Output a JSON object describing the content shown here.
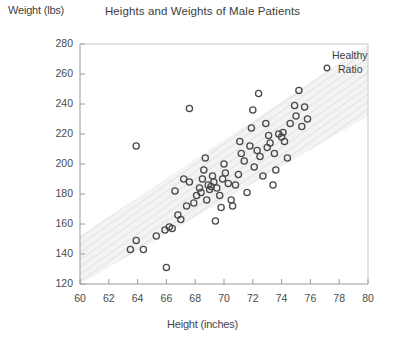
{
  "chart_data": {
    "type": "scatter",
    "title": "Heights and Weights of Male Patients",
    "xlabel": "Height (inches)",
    "ylabel": "Weight (lbs)",
    "xlim": [
      60,
      80
    ],
    "ylim": [
      120,
      280
    ],
    "xticks": [
      60,
      62,
      64,
      66,
      68,
      70,
      72,
      74,
      76,
      78,
      80
    ],
    "yticks": [
      120,
      140,
      160,
      180,
      200,
      220,
      240,
      260,
      280
    ],
    "grid": false,
    "legend": {
      "position": "top-right",
      "entries": [
        {
          "label_line1": "Healthy",
          "label_line2": "Ratio",
          "marker": "open-circle"
        }
      ]
    },
    "band": {
      "name": "healthy-ratio-band",
      "description": "diagonal hatched shaded region from lower-left to upper-right",
      "color": "#e8e8e8",
      "lower_edge": [
        [
          60,
          120
        ],
        [
          80,
          232
        ]
      ],
      "upper_edge": [
        [
          60,
          152
        ],
        [
          80,
          280
        ]
      ]
    },
    "series": [
      {
        "name": "Healthy Ratio",
        "marker": "open-circle",
        "marker_color": "#4a4a4a",
        "points": [
          [
            63.5,
            143
          ],
          [
            63.9,
            149
          ],
          [
            64.4,
            143
          ],
          [
            65.3,
            152
          ],
          [
            65.9,
            156
          ],
          [
            66.2,
            158
          ],
          [
            66.4,
            157
          ],
          [
            66.0,
            131
          ],
          [
            63.9,
            212
          ],
          [
            66.8,
            166
          ],
          [
            67.0,
            163
          ],
          [
            66.6,
            182
          ],
          [
            67.6,
            188
          ],
          [
            67.4,
            172
          ],
          [
            67.9,
            174
          ],
          [
            67.6,
            237
          ],
          [
            68.3,
            184
          ],
          [
            68.4,
            181
          ],
          [
            68.1,
            179
          ],
          [
            68.6,
            196
          ],
          [
            68.7,
            204
          ],
          [
            68.5,
            190
          ],
          [
            68.9,
            186
          ],
          [
            69.1,
            185
          ],
          [
            69.0,
            183
          ],
          [
            69.2,
            192
          ],
          [
            69.3,
            188
          ],
          [
            69.5,
            184
          ],
          [
            69.4,
            162
          ],
          [
            69.7,
            179
          ],
          [
            69.9,
            190
          ],
          [
            70.1,
            194
          ],
          [
            70.3,
            187
          ],
          [
            70.0,
            200
          ],
          [
            70.6,
            172
          ],
          [
            70.8,
            186
          ],
          [
            71.0,
            193
          ],
          [
            71.2,
            207
          ],
          [
            71.4,
            202
          ],
          [
            71.1,
            215
          ],
          [
            71.6,
            181
          ],
          [
            71.8,
            212
          ],
          [
            71.9,
            224
          ],
          [
            72.1,
            198
          ],
          [
            72.3,
            209
          ],
          [
            72.5,
            205
          ],
          [
            72.0,
            236
          ],
          [
            72.4,
            247
          ],
          [
            72.7,
            192
          ],
          [
            72.9,
            227
          ],
          [
            73.1,
            219
          ],
          [
            73.2,
            214
          ],
          [
            73.0,
            211
          ],
          [
            73.4,
            186
          ],
          [
            73.6,
            196
          ],
          [
            73.8,
            220
          ],
          [
            74.0,
            218
          ],
          [
            74.1,
            221
          ],
          [
            74.2,
            215
          ],
          [
            74.4,
            204
          ],
          [
            74.6,
            227
          ],
          [
            74.9,
            239
          ],
          [
            75.0,
            232
          ],
          [
            75.2,
            249
          ],
          [
            75.4,
            225
          ],
          [
            75.6,
            238
          ],
          [
            75.8,
            230
          ],
          [
            69.8,
            171
          ],
          [
            70.5,
            176
          ],
          [
            73.5,
            207
          ],
          [
            67.2,
            190
          ],
          [
            68.8,
            176
          ]
        ]
      }
    ]
  }
}
